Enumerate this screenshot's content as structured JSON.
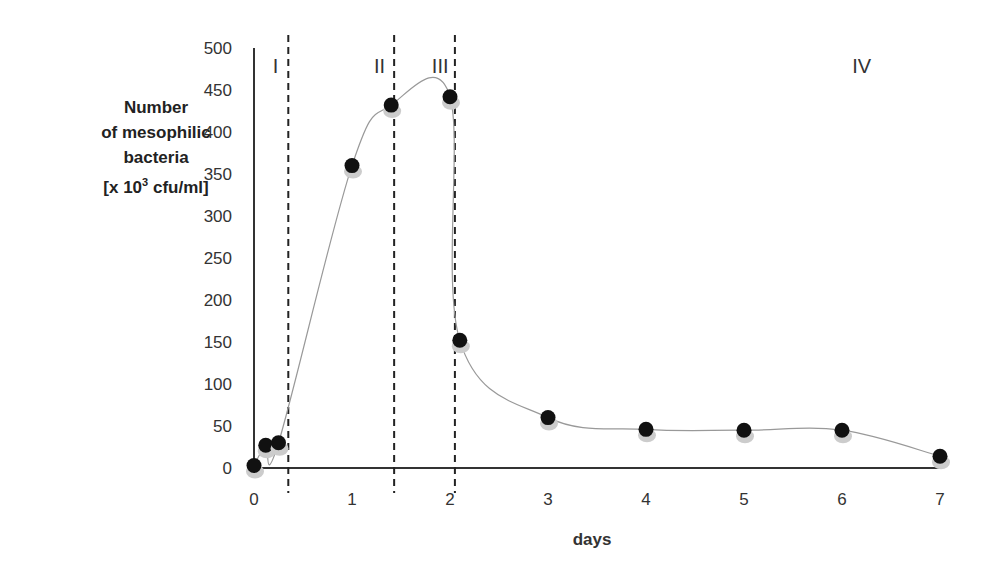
{
  "chart_data": {
    "type": "line",
    "title": "",
    "xlabel": "days",
    "ylabel": [
      "Number",
      "of mesophilic",
      "bacteria",
      "[x 10³ cfu/ml]"
    ],
    "xlim": [
      0,
      7
    ],
    "ylim": [
      0,
      500
    ],
    "x_ticks": [
      0,
      1,
      2,
      3,
      4,
      5,
      6,
      7
    ],
    "y_ticks": [
      0,
      50,
      100,
      150,
      200,
      250,
      300,
      350,
      400,
      450,
      500
    ],
    "grid": false,
    "legend": null,
    "series": [
      {
        "name": "mesophilic bacteria",
        "x": [
          0,
          0.12,
          0.25,
          1,
          1.4,
          2,
          2.1,
          3,
          4,
          5,
          6,
          7
        ],
        "values": [
          3,
          27,
          30,
          360,
          432,
          442,
          152,
          60,
          46,
          45,
          45,
          14
        ]
      }
    ],
    "phase_boundaries": [
      0.35,
      1.43,
      2.05
    ],
    "phase_labels": [
      {
        "label": "I",
        "x": 0.22
      },
      {
        "label": "II",
        "x": 1.28
      },
      {
        "label": "III",
        "x": 1.9
      },
      {
        "label": "IV",
        "x": 6.2
      }
    ]
  },
  "axis": {
    "ylabel_lines": [
      "Number",
      "of mesophilic",
      "bacteria",
      "[x 10"
    ],
    "ylabel_sup": "3",
    "ylabel_tail": " cfu/ml]",
    "xlabel": "days"
  }
}
